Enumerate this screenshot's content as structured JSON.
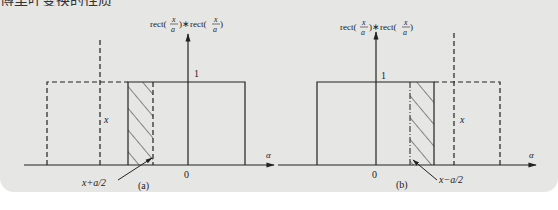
{
  "header": {
    "cut_text": "傅里叶变换的性质"
  },
  "figures": [
    {
      "id": "a",
      "caption": "(a)",
      "y_axis_label": {
        "pre": "rect(",
        "num": "x",
        "den": "a",
        "mid": ")∗rect(",
        "num2": "x",
        "den2": "a",
        "post": ")"
      },
      "x_axis_label": "α",
      "origin_label": "0",
      "height_label": "1",
      "shift_label": "x",
      "edge_label": "x+a/2"
    },
    {
      "id": "b",
      "caption": "(b)",
      "y_axis_label": {
        "pre": "rect(",
        "num": "x",
        "den": "a",
        "mid": ")∗rect(",
        "num2": "x",
        "den2": "a",
        "post": ")"
      },
      "x_axis_label": "α",
      "origin_label": "0",
      "height_label": "1",
      "shift_label": "x",
      "edge_label": "x−a/2"
    }
  ],
  "colors": {
    "panel": "#e6e6e4",
    "ink": "#222222"
  }
}
